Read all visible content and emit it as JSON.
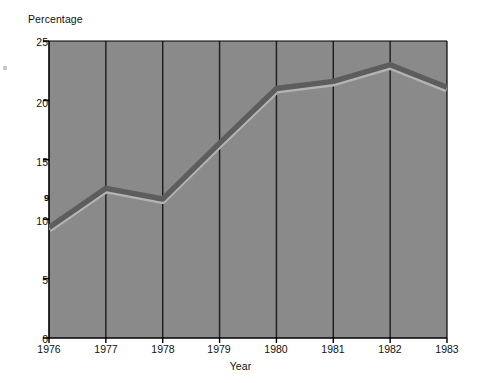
{
  "chart_data": {
    "type": "line",
    "title": "",
    "xlabel": "Year",
    "ylabel": "Percentage",
    "categories": [
      "1976",
      "1977",
      "1978",
      "1979",
      "1980",
      "1981",
      "1982",
      "1983"
    ],
    "x": [
      1976,
      1977,
      1978,
      1979,
      1980,
      1981,
      1982,
      1983
    ],
    "values": [
      9.3,
      12.6,
      11.7,
      16.4,
      21.0,
      21.6,
      23.0,
      21.1
    ],
    "series": [
      {
        "name": "Percentage",
        "values": [
          9.3,
          12.6,
          11.7,
          16.4,
          21.0,
          21.6,
          23.0,
          21.1
        ]
      }
    ],
    "ylim": [
      0,
      25
    ],
    "xlim": [
      1976,
      1983
    ],
    "y_ticks": [
      0,
      5,
      10,
      15,
      20,
      25
    ],
    "y_tick_labels": [
      "0",
      "5",
      "10",
      "15",
      "20",
      "25"
    ],
    "x_ticks": [
      1976,
      1977,
      1978,
      1979,
      1980,
      1981,
      1982,
      1983
    ],
    "x_tick_labels": [
      "1976",
      "1977",
      "1978",
      "1979",
      "1980",
      "1981",
      "1982",
      "1983"
    ],
    "grid": "vertical",
    "legend": "none",
    "annotations": [
      {
        "text": "9.3",
        "x": 1976,
        "y": 9.3
      },
      {
        "text": "21.1",
        "x": 1983,
        "y": 21.1
      }
    ],
    "colors": {
      "plot_background": "#8a8a8a",
      "gridline": "#1c1c1c",
      "axis": "#000000",
      "line": "#5d5d5d",
      "line_highlight": "#b4b4b4",
      "text": "#111111",
      "page_background": "#ffffff"
    }
  }
}
